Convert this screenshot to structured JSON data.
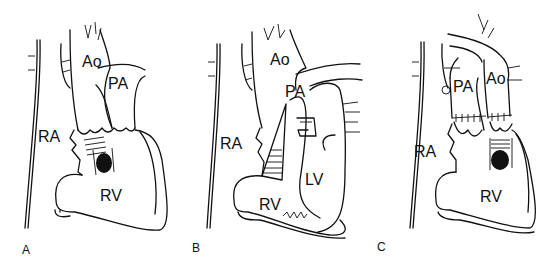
{
  "figure": {
    "panels": [
      {
        "id": "A",
        "panel_label": "A",
        "structures": [
          {
            "label": "Ao",
            "x": 82,
            "y": 54
          },
          {
            "label": "PA",
            "x": 108,
            "y": 76
          },
          {
            "label": "RA",
            "x": 38,
            "y": 129
          },
          {
            "label": "RV",
            "x": 100,
            "y": 188
          }
        ]
      },
      {
        "id": "B",
        "panel_label": "B",
        "structures": [
          {
            "label": "Ao",
            "x": 270,
            "y": 52
          },
          {
            "label": "PA",
            "x": 285,
            "y": 84
          },
          {
            "label": "RA",
            "x": 220,
            "y": 136
          },
          {
            "label": "LV",
            "x": 305,
            "y": 172
          },
          {
            "label": "RV",
            "x": 259,
            "y": 197
          }
        ]
      },
      {
        "id": "C",
        "panel_label": "C",
        "structures": [
          {
            "label": "PA",
            "x": 453,
            "y": 79
          },
          {
            "label": "Ao",
            "x": 486,
            "y": 71
          },
          {
            "label": "RA",
            "x": 414,
            "y": 144
          },
          {
            "label": "RV",
            "x": 480,
            "y": 189
          }
        ]
      }
    ],
    "panel_label_positions": {
      "A": {
        "x": 22,
        "y": 244
      },
      "B": {
        "x": 192,
        "y": 242
      },
      "C": {
        "x": 377,
        "y": 241
      }
    }
  }
}
